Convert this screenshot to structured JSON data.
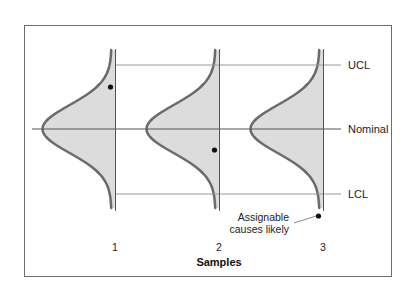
{
  "chart_data": {
    "type": "diagram",
    "title": "",
    "xlabel": "Samples",
    "samples": [
      {
        "label": "1",
        "axis_x": 115.5,
        "mean_y": 129,
        "sigma": 20,
        "point_y": 87
      },
      {
        "label": "2",
        "axis_x": 219.5,
        "mean_y": 129,
        "sigma": 20,
        "point_y": 150
      },
      {
        "label": "3",
        "axis_x": 323.5,
        "mean_y": 129,
        "sigma": 20,
        "point_y": 216
      }
    ],
    "limits": [
      {
        "name": "UCL",
        "y": 65
      },
      {
        "name": "Nominal",
        "y": 129
      },
      {
        "name": "LCL",
        "y": 194
      }
    ],
    "annotation": {
      "text_line1": "Assignable",
      "text_line2": "causes likely",
      "target_sample": "3"
    }
  },
  "labels": {
    "ucl": "UCL",
    "nominal": "Nominal",
    "lcl": "LCL",
    "xlabel": "Samples",
    "tick1": "1",
    "tick2": "2",
    "tick3": "3",
    "annot1": "Assignable",
    "annot2": "causes likely"
  },
  "colors": {
    "curve": "#6a6a6a",
    "fill": "#dcdcdc",
    "line": "#9a9a9a",
    "axis": "#555555",
    "point": "#111111"
  }
}
